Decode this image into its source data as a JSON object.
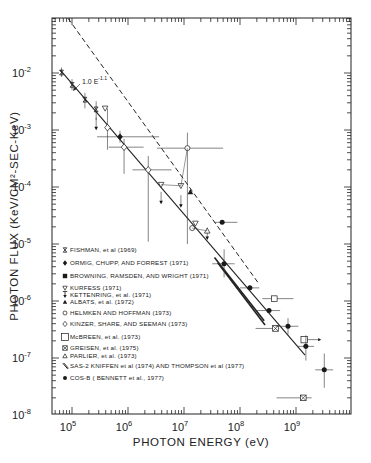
{
  "chart_data": {
    "type": "scatter",
    "title": "",
    "xlabel": "PHOTON ENERGY (eV)",
    "ylabel": "PHOTON FLUX (KeV/CM²-SEC-KeV)",
    "xscale": "log",
    "yscale": "log",
    "xlim": [
      44000,
      10000000000
    ],
    "ylim": [
      1e-08,
      0.1
    ],
    "x_ticks": [
      {
        "value": 100000,
        "label_base": "10",
        "label_exp": "5"
      },
      {
        "value": 1000000,
        "label_base": "10",
        "label_exp": "6"
      },
      {
        "value": 10000000,
        "label_base": "10",
        "label_exp": "7"
      },
      {
        "value": 100000000,
        "label_base": "10",
        "label_exp": "8"
      },
      {
        "value": 1000000000,
        "label_base": "10",
        "label_exp": "9"
      }
    ],
    "y_ticks": [
      {
        "value": 0.01,
        "label_base": "10",
        "label_exp": "-2"
      },
      {
        "value": 0.001,
        "label_base": "10",
        "label_exp": "-3"
      },
      {
        "value": 0.0001,
        "label_base": "10",
        "label_exp": "-4"
      },
      {
        "value": 1e-05,
        "label_base": "10",
        "label_exp": "-5"
      },
      {
        "value": 1e-06,
        "label_base": "10",
        "label_exp": "-6"
      },
      {
        "value": 1e-07,
        "label_base": "10",
        "label_exp": "-7"
      },
      {
        "value": 1e-08,
        "label_base": "10",
        "label_exp": "-8"
      }
    ],
    "grid": false,
    "legend_position": "inside lower-left",
    "annotations": [
      {
        "text_base": "1.0 E",
        "text_exp": "-1.1",
        "x": 200000,
        "y": 0.008
      }
    ],
    "lines": [
      {
        "name": "fit 1.0 E^-1.1",
        "style": "solid",
        "x": [
          62000,
          1450000000
        ],
        "y": [
          0.0112,
          1.12e-07
        ]
      },
      {
        "name": "upper envelope",
        "style": "dashed",
        "x": [
          85000,
          210000000
        ],
        "y": [
          0.091,
          2.1e-06
        ]
      },
      {
        "name": "SAS-2 band upper",
        "style": "solid-thick",
        "x": [
          35000000,
          270000000
        ],
        "y": [
          5.8e-06,
          4.5e-07
        ]
      },
      {
        "name": "SAS-2 band lower",
        "style": "solid-thick",
        "x": [
          40000000,
          280000000
        ],
        "y": [
          4.7e-06,
          3.8e-07
        ]
      }
    ],
    "series": [
      {
        "name": "FISHMAN, et al. (1969)",
        "marker": "hourglass",
        "points": [
          {
            "x": 65000,
            "y": 0.0102,
            "yerr": [
              0.0085,
              0.0125
            ]
          },
          {
            "x": 100000,
            "y": 0.0062,
            "yerr": [
              0.005,
              0.0078
            ]
          },
          {
            "x": 170000,
            "y": 0.0034,
            "yerr": [
              0.0024,
              0.0045
            ]
          },
          {
            "x": 270000,
            "y": 0.0023,
            "yerr": [
              0.0015,
              0.0032
            ]
          }
        ]
      },
      {
        "name": "ORMIG, CHUPP, AND FORREST (1971)",
        "marker": "filled-diamond",
        "points": [
          {
            "x": 720000,
            "y": 0.00076,
            "xerr": [
              280000,
              3600000
            ],
            "yerr": [
              0.0006,
              0.00097
            ]
          }
        ]
      },
      {
        "name": "BROWNING, RAMSDEN, AND WRIGHT (1971)",
        "marker": "filled-square",
        "points": []
      },
      {
        "name": "KURFESS (1971)",
        "marker": "open-triangle-down",
        "points": [
          {
            "x": 390000,
            "y": 0.0024
          },
          {
            "x": 3900000,
            "y": 0.00011
          },
          {
            "x": 8800000,
            "y": 0.000105
          },
          {
            "x": 16000000,
            "y": 2.3e-05
          }
        ]
      },
      {
        "name": "KETTENRING, et al. (1971)",
        "marker": "arrow-down-upper-limit",
        "points": [
          {
            "x": 270000,
            "y": 0.0011,
            "upper_limit": true
          },
          {
            "x": 3900000,
            "y": 5.5e-05,
            "upper_limit": true
          },
          {
            "x": 8800000,
            "y": 4.8e-05,
            "upper_limit": true
          },
          {
            "x": 26000000,
            "y": 1.3e-05,
            "upper_limit": true
          }
        ]
      },
      {
        "name": "ALBATS, et al. (1972)",
        "marker": "filled-triangle",
        "points": [
          {
            "x": 13000000,
            "y": 8.2e-05
          }
        ]
      },
      {
        "name": "HELMKEN AND HOFFMAN (1973)",
        "marker": "open-circle",
        "points": [
          {
            "x": 11500000,
            "y": 0.00048,
            "xerr": [
              3300000,
              50000000
            ],
            "yerr": [
              1e-05,
              0.0009
            ]
          },
          {
            "x": 14000000,
            "y": 1.9e-05
          }
        ]
      },
      {
        "name": "KINZER, SHARE, AND SEEMAN (1973)",
        "marker": "open-diamond",
        "points": [
          {
            "x": 430000,
            "y": 0.0011,
            "yerr": [
              0.00045,
              0.0024
            ]
          },
          {
            "x": 850000,
            "y": 0.0005,
            "xerr": [
              450000,
              1900000
            ],
            "yerr": [
              0.00017,
              0.0007
            ]
          },
          {
            "x": 2300000,
            "y": 0.0002,
            "xerr": [
              1200000,
              6000000
            ],
            "yerr": [
              1.1e-05,
              0.00035
            ]
          }
        ]
      },
      {
        "name": "McBREEN, et al. (1973)",
        "marker": "open-square",
        "points": [
          {
            "x": 410000000,
            "y": 1.1e-06,
            "xerr": [
              250000000,
              900000000
            ]
          },
          {
            "x": 1400000000,
            "y": 2.1e-07,
            "lower_limit_x": true
          }
        ]
      },
      {
        "name": "GREISEN, et al. (1975)",
        "marker": "crossed-square",
        "points": [
          {
            "x": 430000000,
            "y": 3.3e-07,
            "xerr": [
              190000000,
              500000000
            ]
          },
          {
            "x": 1350000000,
            "y": 2e-08,
            "xerr": [
              450000000,
              1900000000
            ]
          }
        ]
      },
      {
        "name": "PARLIER, et al. (1973)",
        "marker": "open-triangle",
        "points": [
          {
            "x": 26000000,
            "y": 1.7e-05
          }
        ]
      },
      {
        "name": "SAS-2 KNIFFEN et al (1974) AND THOMPSON et al (1977)",
        "marker": "line-band",
        "points": []
      },
      {
        "name": "COS-B (BENNETT et al., 1977)",
        "marker": "filled-circle",
        "points": [
          {
            "x": 48000000,
            "y": 2.4e-05,
            "xerr": [
              35000000,
              90000000
            ]
          },
          {
            "x": 52000000,
            "y": 4.5e-06,
            "xerr": [
              32000000,
              80000000
            ],
            "yerr": [
              2.6e-06,
              8.1e-06
            ]
          },
          {
            "x": 150000000,
            "y": 1.7e-06,
            "xerr": [
              100000000,
              220000000
            ]
          },
          {
            "x": 330000000,
            "y": 6.8e-07,
            "xerr": [
              200000000,
              520000000
            ]
          },
          {
            "x": 720000000,
            "y": 3.6e-07,
            "xerr": [
              430000000,
              1100000000
            ],
            "yerr": [
              2.6e-07,
              5e-07
            ]
          },
          {
            "x": 1500000000,
            "y": 1.6e-07,
            "xerr": [
              1050000000,
              2100000000
            ],
            "yerr": [
              9e-08,
              2.5e-07
            ]
          },
          {
            "x": 3200000000,
            "y": 6.2e-08,
            "xerr": [
              2200000000,
              4600000000
            ],
            "yerr": [
              3e-08,
              1.2e-07
            ]
          }
        ]
      }
    ]
  },
  "legend": {
    "items": [
      {
        "marker": "hourglass",
        "label": "FISHMAN, et al (1969)"
      },
      {
        "marker": "filled-diamond",
        "label": "ORMIG, CHUPP, AND FORREST (1971)"
      },
      {
        "marker": "filled-square",
        "label": "BROWNING, RAMSDEN, AND WRIGHT (1971)"
      },
      {
        "marker": "open-triangle-down",
        "label": "KURFESS (1971)"
      },
      {
        "marker": "arrow-down-upper-limit",
        "label": "KETTENRING, et al. (1971)"
      },
      {
        "marker": "filled-triangle",
        "label": "ALBATS, et al. (1972)"
      },
      {
        "marker": "open-circle",
        "label": "HELMKEN AND HOFFMAN (1973)"
      },
      {
        "marker": "open-diamond",
        "label": "KINZER, SHARE, AND SEEMAN (1973)"
      },
      {
        "marker": "open-square",
        "label": "McBREEN, et al. (1973)"
      },
      {
        "marker": "crossed-square",
        "label": "GREISEN, et al. (1975)"
      },
      {
        "marker": "open-triangle",
        "label": "PARLIER, et al. (1973)"
      },
      {
        "marker": "line-band",
        "label": "SAS-2 KNIFFEN et al (1974) AND THOMPSON et al (1977)"
      },
      {
        "marker": "filled-circle",
        "label": "COS-B ( BENNETT et al., 1977)"
      }
    ]
  },
  "axes": {
    "xlabel": "PHOTON ENERGY (eV)",
    "ylabel": "PHOTON FLUX (KeV/CM²-SEC-KeV)",
    "annotation_base": "1.0 E",
    "annotation_exp": "-1.1"
  }
}
